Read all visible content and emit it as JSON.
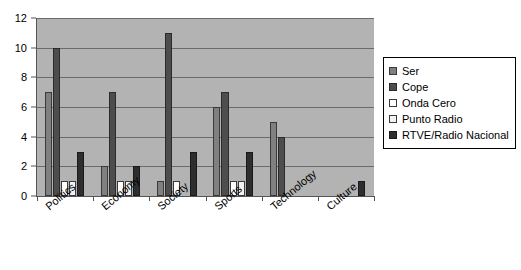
{
  "chart_data": {
    "type": "bar",
    "title": "",
    "subtitle": "",
    "xlabel": "",
    "ylabel": "",
    "ylim": [
      0,
      12
    ],
    "yticks": [
      0,
      2,
      4,
      6,
      8,
      10,
      12
    ],
    "grid": true,
    "legend_position": "right",
    "categories": [
      "Politics",
      "Economy",
      "Society",
      "Sports",
      "Technology",
      "Culture"
    ],
    "series": [
      {
        "name": "Ser",
        "color": "#808080",
        "border": "#3a3a3a",
        "values": [
          7,
          2,
          1,
          6,
          5,
          0
        ]
      },
      {
        "name": "Cope",
        "color": "#4d4d4d",
        "border": "#2b2b2b",
        "values": [
          10,
          7,
          11,
          7,
          4,
          0
        ]
      },
      {
        "name": "Onda Cero",
        "color": "#ffffff",
        "border": "#3a3a3a",
        "values": [
          1,
          1,
          1,
          1,
          0,
          0
        ]
      },
      {
        "name": "Punto Radio",
        "color": "#f2f2f2",
        "border": "#3a3a3a",
        "values": [
          1,
          1,
          0,
          1,
          0,
          0
        ]
      },
      {
        "name": "RTVE/Radio Nacional",
        "color": "#2e2e2e",
        "border": "#1a1a1a",
        "values": [
          3,
          2,
          3,
          3,
          0,
          1
        ]
      }
    ]
  },
  "plot": {
    "background_color": "#b3b3b3",
    "gridline_color": "#6b6b6b",
    "axis_color": "#555555"
  }
}
